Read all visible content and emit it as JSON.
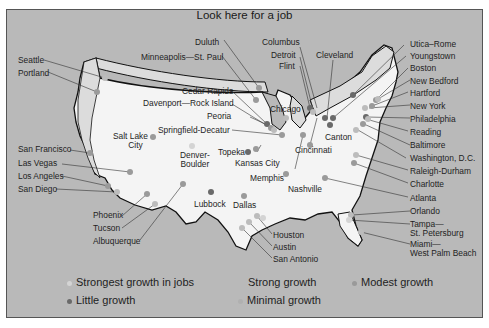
{
  "title": "Look here for a job",
  "colors": {
    "background": "#b9b9b9",
    "land": "#f4f4f4",
    "strongest": "#d4d4d4",
    "strong": "#bcbcbc",
    "modest": "#9a9a9a",
    "minimal": "#b0b0b0",
    "little": "#6a6a6a"
  },
  "labels": {
    "seattle": "Seattle",
    "portland": "Portland",
    "san_francisco": "San Francisco",
    "las_vegas": "Las Vegas",
    "los_angeles": "Los Angeles",
    "san_diego": "San Diego",
    "phoenix": "Phoenix",
    "tucson": "Tucson",
    "albuquerque": "Albuquerque",
    "salt_lake_city_1": "Salt Lake",
    "salt_lake_city_2": "City",
    "denver_boulder_1": "Denver-",
    "denver_boulder_2": "Boulder",
    "lubbock": "Lubbock",
    "dallas": "Dallas",
    "houston": "Houston",
    "austin": "Austin",
    "san_antonio": "San Antonio",
    "topeka": "Topeka",
    "kansas_city": "Kansas City",
    "memphis": "Memphis",
    "nashville": "Nashville",
    "duluth": "Duluth",
    "minneapolis": "Minneapolis—St. Paul",
    "cedar_rapids": "Cedar Rapids",
    "davenport": "Davenport—Rock Island",
    "peoria": "Peoria",
    "springfield": "Springfield-Decatur",
    "chicago": "Chicago",
    "columbus": "Columbus",
    "detroit": "Detroit",
    "flint": "Flint",
    "cleveland": "Cleveland",
    "canton": "Canton",
    "cincinnati": "Cincinnati",
    "utica": "Utica–Rome",
    "youngstown": "Youngstown",
    "boston": "Boston",
    "new_bedford": "New Bedford",
    "hartford": "Hartford",
    "new_york": "New York",
    "philadelphia": "Philadelphia",
    "reading": "Reading",
    "baltimore": "Baltimore",
    "washington": "Washington, D.C.",
    "raleigh": "Raleigh-Durham",
    "charlotte": "Charlotte",
    "atlanta": "Atlanta",
    "orlando": "Orlando",
    "tampa_1": "Tampa—",
    "tampa_2": "St. Petersburg",
    "miami_1": "Miami—",
    "miami_2": "West Palm Beach"
  },
  "legend": {
    "strongest": "Strongest growth in jobs",
    "strong": "Strong growth",
    "modest": "Modest growth",
    "little": "Little growth",
    "minimal": "Minimal growth"
  }
}
